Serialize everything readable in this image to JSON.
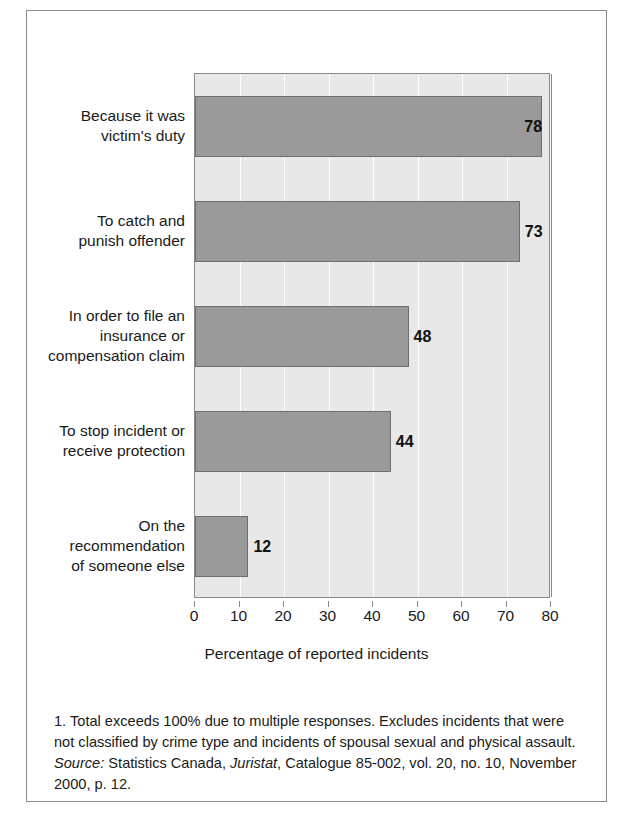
{
  "chart_data": {
    "type": "bar",
    "orientation": "horizontal",
    "title": "",
    "xlabel": "Percentage of reported incidents",
    "ylabel": "",
    "xlim": [
      0,
      80
    ],
    "xticks": [
      0,
      10,
      20,
      30,
      40,
      50,
      60,
      70,
      80
    ],
    "xtick_labels": [
      "0",
      "10",
      "20",
      "30",
      "40",
      "50",
      "60",
      "70",
      "80"
    ],
    "grid": true,
    "legend": false,
    "categories": [
      "Because it was\nvictim's duty",
      "To catch and\npunish offender",
      "In order to file an\ninsurance or\ncompensation claim",
      "To stop incident or\nreceive protection",
      "On the\nrecommendation\nof someone else"
    ],
    "values": [
      78,
      73,
      48,
      44,
      12
    ],
    "value_labels": [
      "78",
      "73",
      "48",
      "44",
      "12"
    ],
    "bar_color": "#9a9a9a",
    "bar_edge_color": "#6e6e6e",
    "plot_background": "#e8e8e8",
    "gridline_color": "#ffffff"
  },
  "categories": [
    {
      "lines": [
        "Because it was",
        "victim's duty"
      ],
      "value": 78,
      "label": "78",
      "label_placement": "inside"
    },
    {
      "lines": [
        "To catch and",
        "punish offender"
      ],
      "value": 73,
      "label": "73",
      "label_placement": "outside"
    },
    {
      "lines": [
        "In order to file an",
        "insurance or",
        "compensation claim"
      ],
      "value": 48,
      "label": "48",
      "label_placement": "outside"
    },
    {
      "lines": [
        "To stop incident or",
        "receive protection"
      ],
      "value": 44,
      "label": "44",
      "label_placement": "outside"
    },
    {
      "lines": [
        "On the",
        "recommendation",
        "of someone else"
      ],
      "value": 12,
      "label": "12",
      "label_placement": "outside"
    }
  ],
  "axis": {
    "x_title": "Percentage of reported incidents",
    "ticks": [
      "0",
      "10",
      "20",
      "30",
      "40",
      "50",
      "60",
      "70",
      "80"
    ]
  },
  "footnote": {
    "note_number": "1.",
    "note_text": "Total exceeds 100% due to multiple responses. Excludes incidents that were not classified by crime type and incidents of spousal sexual and physical assault.",
    "source_label": "Source:",
    "source_agency": "Statistics Canada,",
    "publication": "Juristat",
    "source_rest": ", Catalogue 85-002, vol. 20, no. 10, November 2000, p. 12."
  }
}
